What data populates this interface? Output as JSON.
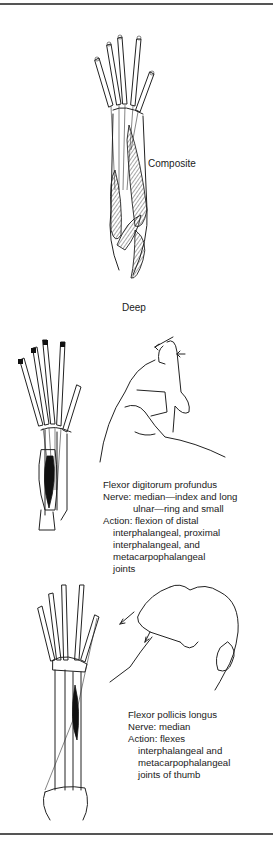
{
  "figure": {
    "top_rule": true,
    "bottom_rule": true,
    "panels": [
      {
        "id": "composite-deep",
        "illustration": "forearm-hand-muscle-illustration",
        "labels": {
          "composite": "Composite",
          "deep": "Deep"
        }
      },
      {
        "id": "flexor-digitorum-profundus",
        "illustrations": [
          "forearm-skeleton-fdp-illustration",
          "hand-finger-flexion-test-illustration"
        ],
        "caption": {
          "title": "Flexor digitorum profundus",
          "nerve_line1": "Nerve: median—index and long",
          "nerve_line2": "ulnar—ring and small",
          "action_line1": "Action: flexion of distal",
          "action_line2": "interphalangeal, proximal",
          "action_line3": "interphalangeal, and",
          "action_line4": "metacarpophalangeal",
          "action_line5": "joints"
        }
      },
      {
        "id": "flexor-pollicis-longus",
        "illustrations": [
          "forearm-skeleton-fpl-illustration",
          "thumb-flexion-test-illustration"
        ],
        "caption": {
          "title": "Flexor pollicis longus",
          "nerve_line1": "Nerve: median",
          "action_line1": "Action: flexes",
          "action_line2": "interphalangeal and",
          "action_line3": "metacarpophalangeal",
          "action_line4": "joints of thumb"
        }
      }
    ]
  },
  "colors": {
    "ink": "#1a1a1a",
    "rule": "#555555",
    "background": "#ffffff"
  }
}
